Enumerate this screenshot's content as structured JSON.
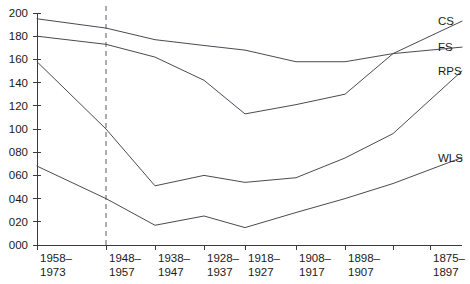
{
  "chart_data": {
    "type": "line",
    "title": "",
    "xlabel": "",
    "ylabel": "",
    "ylim": [
      0,
      200
    ],
    "ytick_step": 20,
    "grid": false,
    "legend_position": "right-of-lines",
    "categories": [
      "1958–1973",
      "1948–1957",
      "1938–1947",
      "1928–1937",
      "1918–1927",
      "1908–1917",
      "1898–1907",
      "",
      "1875–1897"
    ],
    "ytick_labels": [
      "000",
      "020",
      "040",
      "060",
      "080",
      "100",
      "120",
      "140",
      "160",
      "180",
      "200"
    ],
    "ytick_values": [
      0,
      20,
      40,
      60,
      80,
      100,
      120,
      140,
      160,
      180,
      200
    ],
    "annotations": [
      {
        "type": "vertical-dashed-line",
        "at_category": "1948–1957",
        "label": ""
      }
    ],
    "series": [
      {
        "name": "CS",
        "values": [
          195,
          187,
          177,
          172,
          168,
          158,
          158,
          165,
          180
        ]
      },
      {
        "name": "FS",
        "values": [
          180,
          173,
          162,
          142,
          113,
          121,
          130,
          165,
          168
        ]
      },
      {
        "name": "RPS",
        "values": [
          158,
          100,
          51,
          60,
          54,
          58,
          75,
          96,
          125
        ]
      },
      {
        "name": "WLS",
        "values": [
          68,
          40,
          17,
          25,
          15,
          28,
          40,
          53,
          65
        ]
      }
    ],
    "legend": [
      "CS",
      "FS",
      "RPS",
      "WLS"
    ],
    "colors": {
      "line": "#4a4a52",
      "axis": "#3b3b3b",
      "reference_line": "#8c8c8c",
      "text": "#1a1a1a",
      "background": "#ffffff"
    }
  }
}
